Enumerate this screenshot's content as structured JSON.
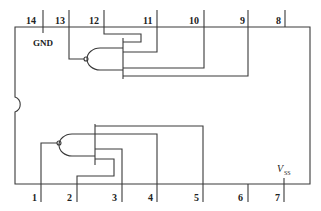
{
  "caption_fragment": "",
  "colors": {
    "line": "#3a3a3a",
    "text": "#222222",
    "background": "#ffffff"
  },
  "chip": {
    "type": "14-pin DIP IC, dual 4-input NAND gates",
    "power_labels": {
      "gnd": "GND",
      "vss_main": "V",
      "vss_sub": "SS"
    },
    "top_pins": [
      {
        "num": "14",
        "x": 43
      },
      {
        "num": "13",
        "x": 69
      },
      {
        "num": "12",
        "x": 104
      },
      {
        "num": "11",
        "x": 157
      },
      {
        "num": "10",
        "x": 204
      },
      {
        "num": "9",
        "x": 248
      },
      {
        "num": "8",
        "x": 285
      }
    ],
    "bottom_pins": [
      {
        "num": "1",
        "x": 41
      },
      {
        "num": "2",
        "x": 77
      },
      {
        "num": "3",
        "x": 122
      },
      {
        "num": "4",
        "x": 157
      },
      {
        "num": "5",
        "x": 203
      },
      {
        "num": "6",
        "x": 248
      },
      {
        "num": "7",
        "x": 284
      }
    ],
    "gates": [
      {
        "name": "upper-nand",
        "output_pin": "13",
        "input_pins": [
          "12",
          "11",
          "10",
          "9"
        ]
      },
      {
        "name": "lower-nand",
        "output_pin": "1",
        "input_pins": [
          "2",
          "3",
          "4",
          "5"
        ]
      }
    ]
  }
}
